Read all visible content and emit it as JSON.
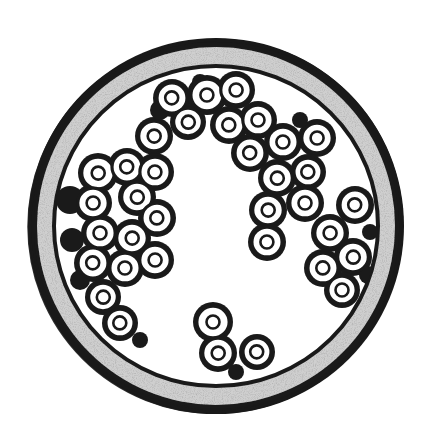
{
  "image": {
    "description": "Hand-drawn ink illustration of a circular cross-section with a stippled gray wall and clusters of ring-shaped cells lining the inner lumen",
    "width": 432,
    "height": 444
  },
  "colors": {
    "background": "#ffffff",
    "ink": "#1a1a1a",
    "wall_fill": "#cfcfcf",
    "wall_stipple": "#8a8a8a",
    "cell_fill": "#ffffff",
    "lumen": "#ffffff"
  },
  "vessel": {
    "cx": 216,
    "cy": 226,
    "outer_radius_x": 188,
    "outer_radius_y": 188,
    "outer_border_width": 9,
    "wall_inner_radius_x": 162,
    "wall_inner_radius_y": 160,
    "inner_border_width": 4
  },
  "cell_style": {
    "radius": 15,
    "stroke_width": 3.2,
    "nucleus_radius": 6.5,
    "nucleus_stroke": 2.6
  },
  "cells": [
    {
      "x": 172,
      "y": 98,
      "r": 15,
      "group": "top"
    },
    {
      "x": 207,
      "y": 95,
      "r": 16,
      "group": "top"
    },
    {
      "x": 236,
      "y": 90,
      "r": 15,
      "group": "top"
    },
    {
      "x": 188,
      "y": 122,
      "r": 14,
      "group": "top"
    },
    {
      "x": 229,
      "y": 125,
      "r": 15,
      "group": "top"
    },
    {
      "x": 258,
      "y": 120,
      "r": 15,
      "group": "top"
    },
    {
      "x": 154,
      "y": 136,
      "r": 15,
      "group": "top"
    },
    {
      "x": 250,
      "y": 153,
      "r": 15,
      "group": "right"
    },
    {
      "x": 283,
      "y": 142,
      "r": 15,
      "group": "right"
    },
    {
      "x": 317,
      "y": 138,
      "r": 15,
      "group": "right"
    },
    {
      "x": 277,
      "y": 178,
      "r": 15,
      "group": "right"
    },
    {
      "x": 308,
      "y": 172,
      "r": 14,
      "group": "right"
    },
    {
      "x": 305,
      "y": 203,
      "r": 15,
      "group": "right"
    },
    {
      "x": 268,
      "y": 210,
      "r": 15,
      "group": "right"
    },
    {
      "x": 355,
      "y": 205,
      "r": 15,
      "group": "right"
    },
    {
      "x": 267,
      "y": 242,
      "r": 15,
      "group": "right"
    },
    {
      "x": 330,
      "y": 233,
      "r": 15,
      "group": "right"
    },
    {
      "x": 353,
      "y": 257,
      "r": 15,
      "group": "right"
    },
    {
      "x": 323,
      "y": 268,
      "r": 15,
      "group": "right"
    },
    {
      "x": 342,
      "y": 290,
      "r": 14,
      "group": "right"
    },
    {
      "x": 98,
      "y": 173,
      "r": 16,
      "group": "left"
    },
    {
      "x": 127,
      "y": 167,
      "r": 15,
      "group": "left"
    },
    {
      "x": 155,
      "y": 172,
      "r": 15,
      "group": "left"
    },
    {
      "x": 93,
      "y": 203,
      "r": 15,
      "group": "left"
    },
    {
      "x": 137,
      "y": 197,
      "r": 15,
      "group": "left"
    },
    {
      "x": 157,
      "y": 218,
      "r": 15,
      "group": "left"
    },
    {
      "x": 100,
      "y": 233,
      "r": 15,
      "group": "left"
    },
    {
      "x": 132,
      "y": 238,
      "r": 15,
      "group": "left"
    },
    {
      "x": 93,
      "y": 263,
      "r": 15,
      "group": "left"
    },
    {
      "x": 125,
      "y": 268,
      "r": 15,
      "group": "left"
    },
    {
      "x": 155,
      "y": 260,
      "r": 15,
      "group": "left"
    },
    {
      "x": 103,
      "y": 297,
      "r": 14,
      "group": "left"
    },
    {
      "x": 120,
      "y": 323,
      "r": 14,
      "group": "left"
    },
    {
      "x": 213,
      "y": 322,
      "r": 16,
      "group": "bottom"
    },
    {
      "x": 218,
      "y": 353,
      "r": 15,
      "group": "bottom"
    },
    {
      "x": 257,
      "y": 352,
      "r": 14,
      "group": "bottom"
    }
  ],
  "fillers": [
    {
      "x": 70,
      "y": 200,
      "r": 14
    },
    {
      "x": 72,
      "y": 240,
      "r": 12
    },
    {
      "x": 80,
      "y": 280,
      "r": 10
    },
    {
      "x": 160,
      "y": 110,
      "r": 10
    },
    {
      "x": 200,
      "y": 82,
      "r": 8
    },
    {
      "x": 300,
      "y": 120,
      "r": 8
    },
    {
      "x": 370,
      "y": 232,
      "r": 8
    },
    {
      "x": 368,
      "y": 275,
      "r": 9
    },
    {
      "x": 236,
      "y": 372,
      "r": 8
    },
    {
      "x": 140,
      "y": 340,
      "r": 8
    }
  ]
}
